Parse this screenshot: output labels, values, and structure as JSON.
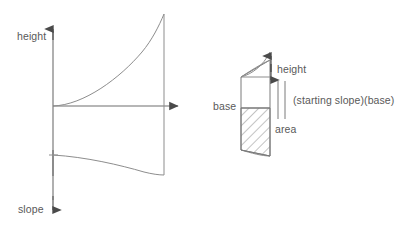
{
  "figure": {
    "background_color": "#ffffff",
    "stroke_color": "#6b6b6b",
    "text_color": "#595959"
  },
  "left_diagram": {
    "name": "height-slope-axes-plot",
    "axis_vertical_label_top": "height",
    "axis_vertical_label_bottom": "slope",
    "origin": {
      "x": 53,
      "y": 106
    },
    "x_axis": {
      "from_x": 53,
      "to_x": 183,
      "y": 106,
      "arrow": "right"
    },
    "y_axis": {
      "x": 53,
      "from_y": 175,
      "to_y": 27,
      "arrow_top": "up",
      "arrow_bottom": "down"
    },
    "upper_curve": {
      "description": "convex increasing curve from origin rising to right edge",
      "start": {
        "x": 53,
        "y": 106
      },
      "end": {
        "x": 164,
        "y": 14
      },
      "right_edge_drop": {
        "x": 164,
        "from_y": 14,
        "to_y": 106
      }
    },
    "lower_curve": {
      "description": "concave decreasing curve falling to right edge",
      "start": {
        "x": 53,
        "y": 155
      },
      "end": {
        "x": 164,
        "y": 175
      },
      "left_edge_tick": {
        "x": 53,
        "y": 155
      }
    }
  },
  "right_diagram": {
    "name": "trapezoid-area-decomposition",
    "labels": {
      "base": "base",
      "height": "height",
      "area": "area",
      "formula": "(starting slope)(base)",
      "equals_symbol": "||"
    },
    "shape": {
      "type": "trapezoid-with-curved-top-and-bottom",
      "left_x": 241,
      "right_x": 270,
      "top_y": 60,
      "bottom_y": 150,
      "height_band": {
        "from_y": 60,
        "to_y": 77
      },
      "middle_band": {
        "from_y": 77,
        "to_y": 108
      },
      "hatched_band": {
        "from_y": 108,
        "to_y": 150,
        "fill": "diagonal-hatch"
      }
    },
    "height_arrow": {
      "x": 271,
      "from_y": 58,
      "to_y": 78,
      "arrow_top": "up",
      "arrow_bottom": "down"
    },
    "parallel_bars": {
      "x1": 277,
      "x2": 284,
      "from_y": 80,
      "to_y": 120
    }
  }
}
